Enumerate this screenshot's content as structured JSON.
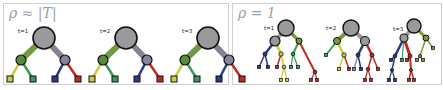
{
  "figure": {
    "panels": [
      {
        "id": "panel-1",
        "title": "ρ ≈ |T|",
        "trees": [
          {
            "label": "t=1"
          },
          {
            "label": "t=2"
          },
          {
            "label": "t=3"
          }
        ]
      },
      {
        "id": "panel-2",
        "title": "ρ = 1",
        "trees": [
          {
            "label": "t=1"
          },
          {
            "label": "t=2"
          },
          {
            "label": "t=3"
          }
        ]
      }
    ],
    "colors": {
      "node_fill": "#9a9a9c",
      "node_stroke": "#111111",
      "green": "#5a8a3a",
      "purple": "#8a80a0",
      "yellow": "#c8d040",
      "light_green": "#3a9a5a",
      "blue": "#2a3a8a",
      "red": "#c02a20",
      "gray_edge": "#9a9a9c",
      "olive": "#7a9a3a",
      "border": "#cfcfcf",
      "title": "#9aa0a8"
    }
  }
}
